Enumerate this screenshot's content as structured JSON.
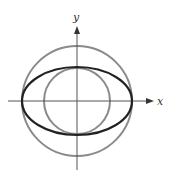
{
  "figure": {
    "axes": {
      "x_label": "x",
      "y_label": "y",
      "color": "#555555"
    },
    "curves": [
      {
        "name": "outer-circle",
        "shape": "circle",
        "cx": 77,
        "cy": 101,
        "r": 55,
        "color": "#8a8a8a",
        "stroke_width": 2
      },
      {
        "name": "inner-circle",
        "shape": "circle",
        "cx": 77,
        "cy": 101,
        "r": 33,
        "color": "#8a8a8a",
        "stroke_width": 2
      },
      {
        "name": "ellipse",
        "shape": "ellipse",
        "cx": 77,
        "cy": 101,
        "rx": 55,
        "ry": 34,
        "color": "#222222",
        "stroke_width": 2.2
      }
    ]
  }
}
